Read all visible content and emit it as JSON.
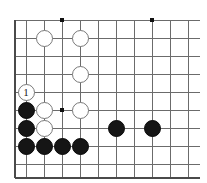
{
  "board": {
    "type": "go-board",
    "title": "Go board position",
    "columns": 10,
    "rows": 9,
    "grid_origin_x": 26,
    "grid_origin_y": 20,
    "grid_spacing": 18,
    "line_color": "#6b6b6b",
    "edge_color": "#4a4a4a",
    "background_color": "#ffffff",
    "black_color": "#151515",
    "white_color": "#ffffff",
    "star_points": [
      {
        "col": 2,
        "row": 0
      },
      {
        "col": 7,
        "row": 0
      },
      {
        "col": 2,
        "row": 5
      }
    ],
    "stones": [
      {
        "id": "w-c1r1",
        "color": "white",
        "col": 1,
        "row": 1,
        "label": ""
      },
      {
        "id": "w-c3r1",
        "color": "white",
        "col": 3,
        "row": 1,
        "label": ""
      },
      {
        "id": "w-c3r3",
        "color": "white",
        "col": 3,
        "row": 3,
        "label": ""
      },
      {
        "id": "w-c0r4",
        "color": "white",
        "col": 0,
        "row": 4,
        "label": "1"
      },
      {
        "id": "b-c0r5",
        "color": "black",
        "col": 0,
        "row": 5,
        "label": ""
      },
      {
        "id": "w-c1r5",
        "color": "white",
        "col": 1,
        "row": 5,
        "label": ""
      },
      {
        "id": "w-c3r5",
        "color": "white",
        "col": 3,
        "row": 5,
        "label": ""
      },
      {
        "id": "b-c0r6",
        "color": "black",
        "col": 0,
        "row": 6,
        "label": ""
      },
      {
        "id": "w-c1r6",
        "color": "white",
        "col": 1,
        "row": 6,
        "label": ""
      },
      {
        "id": "b-c5r6",
        "color": "black",
        "col": 5,
        "row": 6,
        "label": ""
      },
      {
        "id": "b-c7r6",
        "color": "black",
        "col": 7,
        "row": 6,
        "label": ""
      },
      {
        "id": "b-c0r7",
        "color": "black",
        "col": 0,
        "row": 7,
        "label": ""
      },
      {
        "id": "b-c1r7",
        "color": "black",
        "col": 1,
        "row": 7,
        "label": ""
      },
      {
        "id": "b-c2r7",
        "color": "black",
        "col": 2,
        "row": 7,
        "label": ""
      },
      {
        "id": "b-c3r7",
        "color": "black",
        "col": 3,
        "row": 7,
        "label": ""
      }
    ],
    "stone_diameter": 17,
    "last_move_label": "1"
  }
}
